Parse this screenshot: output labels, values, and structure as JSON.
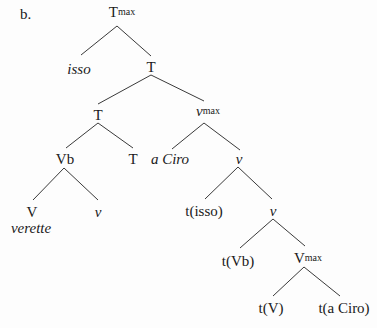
{
  "example_label": "b.",
  "tree": {
    "nodes": [
      {
        "id": "tmax",
        "label": "T",
        "sup": "max",
        "italic": false,
        "x": 122,
        "y": 5
      },
      {
        "id": "isso",
        "label": "isso",
        "sup": "",
        "italic": true,
        "x": 79,
        "y": 62
      },
      {
        "id": "t1",
        "label": "T",
        "sup": "",
        "italic": false,
        "x": 151,
        "y": 60
      },
      {
        "id": "t2",
        "label": "T",
        "sup": "",
        "italic": false,
        "x": 98,
        "y": 108
      },
      {
        "id": "vmax",
        "label": "v",
        "sup": "max",
        "italic": true,
        "x": 208,
        "y": 104
      },
      {
        "id": "vb",
        "label": "Vb",
        "sup": "",
        "italic": false,
        "x": 65,
        "y": 152
      },
      {
        "id": "t3",
        "label": "T",
        "sup": "",
        "italic": false,
        "x": 133,
        "y": 152
      },
      {
        "id": "aciro",
        "label": "a Ciro",
        "sup": "",
        "italic": true,
        "x": 170,
        "y": 152
      },
      {
        "id": "v1",
        "label": "v",
        "sup": "",
        "italic": true,
        "x": 239,
        "y": 152
      },
      {
        "id": "V",
        "label": "V",
        "sup": "",
        "italic": false,
        "x": 32,
        "y": 205
      },
      {
        "id": "verette",
        "label": "verette",
        "sup": "",
        "italic": true,
        "x": 31,
        "y": 221
      },
      {
        "id": "v2",
        "label": "v",
        "sup": "",
        "italic": true,
        "x": 98,
        "y": 205
      },
      {
        "id": "tisso",
        "label": "t(isso)",
        "sup": "",
        "italic": false,
        "x": 204,
        "y": 204
      },
      {
        "id": "v3",
        "label": "v",
        "sup": "",
        "italic": true,
        "x": 273,
        "y": 204
      },
      {
        "id": "tvb",
        "label": "t(Vb)",
        "sup": "",
        "italic": false,
        "x": 238,
        "y": 254
      },
      {
        "id": "Vmax",
        "label": "V",
        "sup": "max",
        "italic": false,
        "x": 308,
        "y": 251
      },
      {
        "id": "tV",
        "label": "t(V)",
        "sup": "",
        "italic": false,
        "x": 271,
        "y": 301
      },
      {
        "id": "taciro",
        "label": "t(a Ciro)",
        "sup": "",
        "italic": false,
        "x": 344,
        "y": 301
      }
    ],
    "edges": [
      [
        117,
        26,
        81,
        55
      ],
      [
        117,
        26,
        151,
        56
      ],
      [
        151,
        75,
        98,
        104
      ],
      [
        151,
        75,
        204,
        101
      ],
      [
        98,
        123,
        66,
        148
      ],
      [
        98,
        123,
        133,
        148
      ],
      [
        204,
        123,
        172,
        149
      ],
      [
        204,
        123,
        240,
        150
      ],
      [
        64,
        168,
        33,
        200
      ],
      [
        64,
        168,
        98,
        200
      ],
      [
        238,
        167,
        205,
        199
      ],
      [
        238,
        167,
        272,
        199
      ],
      [
        273,
        219,
        240,
        248
      ],
      [
        273,
        219,
        305,
        246
      ],
      [
        304,
        267,
        273,
        296
      ],
      [
        304,
        267,
        340,
        296
      ]
    ]
  }
}
